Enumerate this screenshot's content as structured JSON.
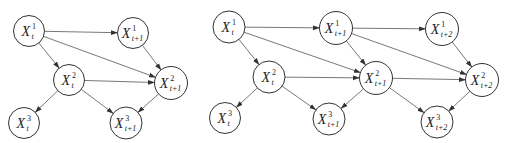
{
  "colors": {
    "node_stroke": "#333333",
    "edge": "#555555",
    "text": "#222222",
    "background": "#ffffff"
  },
  "diagrams": [
    {
      "name": "two-slice-dbn",
      "nodes": [
        {
          "id": "a1",
          "var": "X",
          "sup": "1",
          "sub": "t",
          "cx": 29,
          "cy": 31,
          "r": 15.5
        },
        {
          "id": "b1",
          "var": "X",
          "sup": "1",
          "sub": "t+1",
          "cx": 133,
          "cy": 33,
          "r": 15.5
        },
        {
          "id": "a2",
          "var": "X",
          "sup": "2",
          "sub": "t",
          "cx": 69,
          "cy": 80,
          "r": 15.5
        },
        {
          "id": "b2",
          "var": "X",
          "sup": "2",
          "sub": "t+1",
          "cx": 171,
          "cy": 83,
          "r": 16.5
        },
        {
          "id": "a3",
          "var": "X",
          "sup": "3",
          "sub": "t",
          "cx": 24,
          "cy": 123,
          "r": 15.5
        },
        {
          "id": "b3",
          "var": "X",
          "sup": "3",
          "sub": "t+1",
          "cx": 126,
          "cy": 123,
          "r": 16
        }
      ],
      "edges": [
        [
          "a1",
          "b1"
        ],
        [
          "a1",
          "a2"
        ],
        [
          "a1",
          "b2"
        ],
        [
          "b1",
          "b2"
        ],
        [
          "a2",
          "b2"
        ],
        [
          "a2",
          "a3"
        ],
        [
          "a2",
          "b3"
        ],
        [
          "b2",
          "b3"
        ]
      ]
    },
    {
      "name": "three-slice-dbn",
      "nodes": [
        {
          "id": "a1",
          "var": "X",
          "sup": "1",
          "sub": "t",
          "cx": 229,
          "cy": 27,
          "r": 16
        },
        {
          "id": "b1",
          "var": "X",
          "sup": "1",
          "sub": "t+1",
          "cx": 336,
          "cy": 28,
          "r": 16.5
        },
        {
          "id": "c1",
          "var": "X",
          "sup": "1",
          "sub": "t+2",
          "cx": 442,
          "cy": 29,
          "r": 16.5
        },
        {
          "id": "a2",
          "var": "X",
          "sup": "2",
          "sub": "t",
          "cx": 269,
          "cy": 77,
          "r": 16
        },
        {
          "id": "b2",
          "var": "X",
          "sup": "2",
          "sub": "t+1",
          "cx": 376,
          "cy": 78,
          "r": 16.5
        },
        {
          "id": "c2",
          "var": "X",
          "sup": "2",
          "sub": "t+2",
          "cx": 482,
          "cy": 80,
          "r": 16.5
        },
        {
          "id": "a3",
          "var": "X",
          "sup": "3",
          "sub": "t",
          "cx": 225,
          "cy": 118,
          "r": 15.5
        },
        {
          "id": "b3",
          "var": "X",
          "sup": "3",
          "sub": "t+1",
          "cx": 329,
          "cy": 119,
          "r": 16
        },
        {
          "id": "c3",
          "var": "X",
          "sup": "3",
          "sub": "t+2",
          "cx": 437,
          "cy": 122,
          "r": 16
        }
      ],
      "edges": [
        [
          "a1",
          "b1"
        ],
        [
          "a1",
          "a2"
        ],
        [
          "a1",
          "b2"
        ],
        [
          "b1",
          "c1"
        ],
        [
          "b1",
          "b2"
        ],
        [
          "b1",
          "c2"
        ],
        [
          "c1",
          "c2"
        ],
        [
          "a2",
          "b2"
        ],
        [
          "a2",
          "a3"
        ],
        [
          "a2",
          "b3"
        ],
        [
          "b2",
          "c2"
        ],
        [
          "b2",
          "b3"
        ],
        [
          "b2",
          "c3"
        ],
        [
          "c2",
          "c3"
        ]
      ]
    }
  ]
}
